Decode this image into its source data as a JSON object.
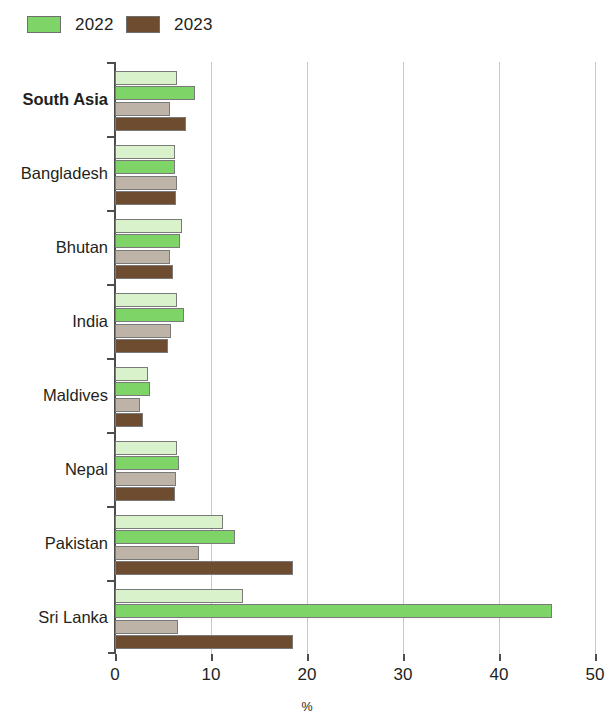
{
  "legend": {
    "items": [
      {
        "label": "2022",
        "color": "#7fd468"
      },
      {
        "label": "2023",
        "color": "#6d4c30"
      }
    ]
  },
  "axis": {
    "x_title": "%",
    "tick_labels": [
      "0",
      "10",
      "20",
      "30",
      "40",
      "50"
    ]
  },
  "chart_data": {
    "type": "bar",
    "orientation": "horizontal",
    "title": "",
    "subtitle": "",
    "xlabel": "%",
    "ylabel": "",
    "xlim": [
      0,
      50
    ],
    "xticks": [
      0,
      10,
      20,
      30,
      40,
      50
    ],
    "grid": true,
    "legend_position": "top-left",
    "legend_entries": [
      "2022",
      "2023"
    ],
    "categories": [
      "South Asia",
      "Bangladesh",
      "Bhutan",
      "India",
      "Maldives",
      "Nepal",
      "Pakistan",
      "Sri Lanka"
    ],
    "emphasized_category": "South Asia",
    "note": "Each category shows four bars: a pale-green and a bright-green bar for 2022, and a tan and a dark-brown bar for 2023.",
    "series": [
      {
        "name": "2022",
        "variant": "pale-green",
        "color": "#d9f2cc",
        "values": [
          6.5,
          6.3,
          7.0,
          6.5,
          3.4,
          6.5,
          11.3,
          13.3
        ]
      },
      {
        "name": "2022",
        "variant": "bright-green",
        "color": "#7fd468",
        "values": [
          8.3,
          6.2,
          6.8,
          7.2,
          3.6,
          6.7,
          12.5,
          45.5
        ]
      },
      {
        "name": "2023",
        "variant": "tan",
        "color": "#bdb3a6",
        "values": [
          5.7,
          6.5,
          5.7,
          5.8,
          2.6,
          6.4,
          8.8,
          6.6
        ]
      },
      {
        "name": "2023",
        "variant": "dark-brown",
        "color": "#6d4c30",
        "values": [
          7.4,
          6.4,
          6.0,
          5.5,
          2.9,
          6.3,
          18.5,
          18.5
        ]
      }
    ]
  }
}
